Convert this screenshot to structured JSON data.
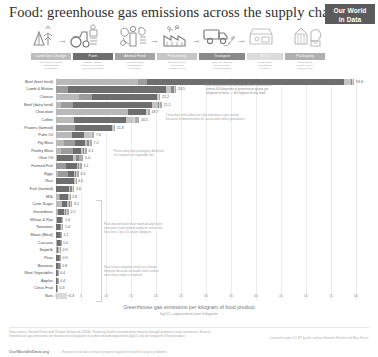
{
  "header": {
    "title": "Food: greenhouse gas emissions across the supply chain",
    "logo_line1": "Our World",
    "logo_line2": "in Data"
  },
  "supply_chain": {
    "icons": [
      {
        "name": "land-use-change-icon",
        "label": "Land Use Change"
      },
      {
        "name": "farm-tractor-icon",
        "label": "Farm"
      },
      {
        "name": "animal-feed-icon",
        "label": "Animal Feed"
      },
      {
        "name": "processing-factory-icon",
        "label": "Processing"
      },
      {
        "name": "transport-truck-icon",
        "label": "Transport"
      },
      {
        "name": "retail-store-icon",
        "label": "Retail"
      },
      {
        "name": "packaging-icon",
        "label": "Packaging"
      }
    ],
    "stages": [
      {
        "label": "Land Use Change",
        "color": "#b9b9b9",
        "desc": "Conversion of forest\nand grassland\nto cropland"
      },
      {
        "label": "Farm",
        "color": "#6e6e6e",
        "desc": "Methane, manure,\nfertilizers, machinery,\nand on-farm energy"
      },
      {
        "label": "Animal Feed",
        "color": "#9c9c9c",
        "desc": "Production and\nprocessing of\nfeed crops"
      },
      {
        "label": "Processing",
        "color": "#c4c4c4",
        "desc": "Energy used to\nconvert raw\nproduce to food"
      },
      {
        "label": "Transport",
        "color": "#8a8a8a",
        "desc": "Road, rail, shipping\nand air freight\nof food products"
      },
      {
        "label": "Retail",
        "color": "#d6d6d6",
        "desc": "Refrigeration\nand lighting\nin stores"
      },
      {
        "label": "Packaging",
        "color": "#acacac",
        "desc": "Materials and\nenergy used to\npackage food"
      }
    ]
  },
  "chart_data": {
    "type": "bar",
    "orientation": "horizontal",
    "stacked": true,
    "title": "Food: greenhouse gas emissions across the supply chain",
    "xlabel": "Greenhouse gas emissions per kilogram of food product",
    "xlabel_sub": "kgCO₂-equivalents per kilogram",
    "ylabel": "",
    "xlim": [
      0,
      60
    ],
    "xticks": [
      0,
      5,
      10,
      15,
      20,
      25,
      30,
      35,
      40,
      45,
      50,
      55,
      60
    ],
    "grid": true,
    "legend_position": "top-band",
    "series": [
      {
        "name": "Land Use Change",
        "color": "#b9b9b9"
      },
      {
        "name": "Animal Feed",
        "color": "#9c9c9c"
      },
      {
        "name": "Farm",
        "color": "#6e6e6e"
      },
      {
        "name": "Processing",
        "color": "#c4c4c4"
      },
      {
        "name": "Transport",
        "color": "#8a8a8a"
      },
      {
        "name": "Retail",
        "color": "#d6d6d6"
      },
      {
        "name": "Packaging",
        "color": "#acacac"
      }
    ],
    "categories": [
      "Beef (beef herd)",
      "Lamb & Mutton",
      "Cheese",
      "Beef (dairy herd)",
      "Chocolate",
      "Coffee",
      "Prawns (farmed)",
      "Palm Oil",
      "Pig Meat",
      "Poultry Meat",
      "Olive Oil",
      "Farmed Fish",
      "Eggs",
      "Rice",
      "Fish (farmed)",
      "Milk",
      "Cane Sugar",
      "Groundnuts",
      "Wheat & Rye",
      "Tomatoes",
      "Maize (Meal)",
      "Cassava",
      "Soymilk",
      "Peas",
      "Bananas",
      "Root Vegetables",
      "Apples",
      "Citrus Fruit",
      "Nuts"
    ],
    "totals": [
      59.6,
      24.5,
      21.2,
      21.1,
      18.7,
      16.5,
      11.8,
      7.6,
      7.2,
      6.1,
      5.4,
      5.1,
      4.5,
      4.0,
      3.6,
      2.8,
      3.2,
      2.5,
      1.4,
      1.4,
      1.1,
      1.0,
      0.9,
      0.9,
      0.8,
      0.4,
      0.4,
      0.3,
      -0.3
    ],
    "segments": [
      {
        "category": "Beef (beef herd)",
        "values": [
          16.3,
          1.9,
          39.4,
          1.3,
          0.3,
          0.2,
          0.2
        ]
      },
      {
        "category": "Lamb & Mutton",
        "values": [
          0.0,
          2.4,
          19.5,
          1.1,
          0.5,
          0.2,
          0.3
        ]
      },
      {
        "category": "Cheese",
        "values": [
          4.5,
          2.6,
          13.1,
          0.1,
          0.1,
          0.2,
          0.2
        ]
      },
      {
        "category": "Beef (dairy herd)",
        "values": [
          0.9,
          2.5,
          15.7,
          1.3,
          0.2,
          0.2,
          0.3
        ]
      },
      {
        "category": "Chocolate",
        "values": [
          14.3,
          0.0,
          3.7,
          0.1,
          0.1,
          0.1,
          0.4
        ]
      },
      {
        "category": "Coffee",
        "values": [
          3.6,
          0.0,
          10.4,
          1.3,
          0.1,
          0.3,
          0.9
        ]
      },
      {
        "category": "Prawns (farmed)",
        "values": [
          0.0,
          3.8,
          7.4,
          0.1,
          0.1,
          0.2,
          0.2
        ]
      },
      {
        "category": "Palm Oil",
        "values": [
          3.1,
          0.0,
          2.4,
          1.4,
          0.1,
          0.1,
          0.5
        ]
      },
      {
        "category": "Pig Meat",
        "values": [
          1.5,
          2.2,
          2.1,
          0.4,
          0.3,
          0.2,
          0.4
        ]
      },
      {
        "category": "Poultry Meat",
        "values": [
          1.0,
          2.4,
          1.5,
          0.4,
          0.2,
          0.2,
          0.4
        ]
      },
      {
        "category": "Olive Oil",
        "values": [
          0.1,
          0.0,
          3.2,
          0.7,
          0.5,
          0.1,
          0.8
        ]
      },
      {
        "category": "Farmed Fish",
        "values": [
          0.0,
          2.0,
          2.2,
          0.1,
          0.2,
          0.2,
          0.4
        ]
      },
      {
        "category": "Eggs",
        "values": [
          0.3,
          2.0,
          1.3,
          0.2,
          0.1,
          0.2,
          0.4
        ]
      },
      {
        "category": "Rice",
        "values": [
          0.0,
          0.0,
          3.6,
          0.1,
          0.1,
          0.1,
          0.1
        ]
      },
      {
        "category": "Fish (farmed)",
        "values": [
          0.0,
          0.0,
          2.6,
          0.2,
          0.4,
          0.2,
          0.2
        ]
      },
      {
        "category": "Milk",
        "values": [
          0.5,
          0.3,
          1.6,
          0.1,
          0.1,
          0.1,
          0.1
        ]
      },
      {
        "category": "Cane Sugar",
        "values": [
          1.2,
          0.0,
          1.0,
          0.4,
          0.2,
          0.1,
          0.3
        ]
      },
      {
        "category": "Groundnuts",
        "values": [
          0.3,
          0.0,
          1.2,
          0.3,
          0.2,
          0.1,
          0.4
        ]
      },
      {
        "category": "Wheat & Rye",
        "values": [
          0.1,
          0.0,
          0.8,
          0.1,
          0.1,
          0.1,
          0.2
        ]
      },
      {
        "category": "Tomatoes",
        "values": [
          0.0,
          0.0,
          0.7,
          0.1,
          0.2,
          0.1,
          0.3
        ]
      },
      {
        "category": "Maize (Meal)",
        "values": [
          0.0,
          0.0,
          0.7,
          0.1,
          0.1,
          0.1,
          0.1
        ]
      },
      {
        "category": "Cassava",
        "values": [
          0.2,
          0.0,
          0.5,
          0.1,
          0.1,
          0.0,
          0.1
        ]
      },
      {
        "category": "Soymilk",
        "values": [
          0.1,
          0.0,
          0.2,
          0.2,
          0.1,
          0.1,
          0.2
        ]
      },
      {
        "category": "Peas",
        "values": [
          0.0,
          0.0,
          0.5,
          0.1,
          0.1,
          0.1,
          0.1
        ]
      },
      {
        "category": "Bananas",
        "values": [
          0.0,
          0.0,
          0.3,
          0.1,
          0.3,
          0.0,
          0.1
        ]
      },
      {
        "category": "Root Vegetables",
        "values": [
          0.0,
          0.0,
          0.2,
          0.0,
          0.1,
          0.0,
          0.1
        ]
      },
      {
        "category": "Apples",
        "values": [
          0.0,
          0.0,
          0.2,
          0.0,
          0.1,
          0.0,
          0.1
        ]
      },
      {
        "category": "Citrus Fruit",
        "values": [
          0.0,
          0.0,
          0.1,
          0.0,
          0.1,
          0.0,
          0.1
        ]
      },
      {
        "category": "Nuts",
        "values": [
          -2.1,
          0.0,
          1.4,
          0.1,
          0.1,
          0.1,
          0.1
        ]
      }
    ],
    "annotations": [
      {
        "id": "beef-note",
        "text": "Beef produced from dedicated beef herds emits\nalmost 60 kilograms of greenhouse gases per\nkilogram of meat — the highest of any food."
      },
      {
        "id": "chocolate-note",
        "text": "Chocolate and coffee are high-emission crops mainly\nbecause of deforestation for cocoa and coffee plantations."
      },
      {
        "id": "oil-note",
        "text": "Processing and packaging dominate\nthe footprint of vegetable oils."
      },
      {
        "id": "plant-note",
        "text": "Plant-based foods have dramatically lower\nemissions than animal products: most emit\nless than 2 kg CO₂eq per kilogram."
      },
      {
        "id": "nuts-note",
        "text": "Nuts have a negative land use change\nfootprint because orchards store carbon\nwhen they replace cropland."
      }
    ]
  },
  "footer": {
    "source": "Data source: Joseph Poore and Thomas Nemecek (2018). Reducing food’s environmental impacts through producers and consumers. Science.\nGreenhouse gas emissions are measured in kilograms of carbon dioxide equivalents (kgCO₂eq) per kilogram of food product.",
    "site": "OurWorldInData.org",
    "license_note": "– Research and data to make progress against the world’s largest problems.",
    "cc": "Licensed under CC-BY by the authors Hannah Ritchie and Max Roser."
  }
}
